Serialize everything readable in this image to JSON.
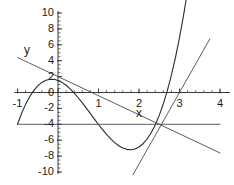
{
  "figure": {
    "background_color": "#ffffff",
    "axis_color": "#3a3a3a",
    "curve_color": "#2b2b2b",
    "line_color": "#4a4a4a",
    "text_color": "#1a1a1a",
    "x_axis_name": "x",
    "y_axis_name": "y"
  },
  "chart_data": {
    "type": "line",
    "title": "",
    "xlabel": "x",
    "ylabel": "y",
    "xlim": [
      -1,
      4
    ],
    "ylim": [
      -10,
      10
    ],
    "grid": false,
    "legend": "none",
    "xticks": [
      -1,
      0,
      1,
      2,
      3,
      4
    ],
    "xticklabels": [
      "-1",
      "0",
      "1",
      "2",
      "3",
      "4"
    ],
    "yticks": [
      -10,
      -8,
      -6,
      -4,
      -2,
      0,
      2,
      4,
      6,
      8,
      10
    ],
    "yticklabels": [
      "-10",
      "-8",
      "-6",
      "-4",
      "-2",
      "0",
      "2",
      "4",
      "6",
      "8",
      "10"
    ],
    "minor_ticks": true,
    "series": [
      {
        "name": "cubic curve",
        "type": "line",
        "expression": "y = x^3 - 3x^2 - x + 3 shifted: cubic with local max near x=-0.2 and local min near x=2, root at x=3",
        "x": [
          -1.0,
          -0.9,
          -0.8,
          -0.7,
          -0.6,
          -0.5,
          -0.4,
          -0.3,
          -0.2,
          -0.1,
          0.0,
          0.1,
          0.2,
          0.3,
          0.4,
          0.5,
          0.6,
          0.7,
          0.8,
          0.9,
          1.0,
          1.1,
          1.2,
          1.3,
          1.4,
          1.5,
          1.6,
          1.7,
          1.8,
          1.9,
          2.0,
          2.1,
          2.2,
          2.3,
          2.4,
          2.5,
          2.6,
          2.7,
          2.8,
          2.9,
          3.0,
          3.1,
          3.2,
          3.3,
          3.4,
          3.5,
          3.6
        ],
        "y": [
          -4.0,
          -2.64,
          -1.49,
          -0.53,
          0.24,
          0.84,
          1.27,
          1.54,
          1.67,
          1.66,
          1.52,
          1.27,
          0.91,
          0.46,
          -0.07,
          -0.66,
          -1.3,
          -1.97,
          -2.66,
          -3.35,
          -4.03,
          -4.68,
          -5.28,
          -5.83,
          -6.3,
          -6.69,
          -6.98,
          -7.15,
          -7.2,
          -7.1,
          -6.85,
          -6.44,
          -5.85,
          -5.07,
          -4.08,
          -2.88,
          -1.44,
          0.24,
          2.18,
          4.39,
          6.89,
          9.69,
          12.81,
          16.26,
          20.06,
          24.22,
          28.77
        ]
      },
      {
        "name": "decreasing line",
        "type": "line",
        "expression": "y = 2 - 2.4x",
        "x": [
          -1.0,
          4.0
        ],
        "y": [
          4.4,
          -7.6
        ]
      },
      {
        "name": "steep tangent line",
        "type": "line",
        "expression": "y = 9(x - 3)",
        "x": [
          1.85,
          3.75
        ],
        "y": [
          -10.35,
          6.75
        ]
      },
      {
        "name": "horizontal line",
        "type": "line",
        "expression": "y = -4",
        "x": [
          -1.0,
          4.0
        ],
        "y": [
          -4.0,
          -4.0
        ]
      }
    ]
  }
}
